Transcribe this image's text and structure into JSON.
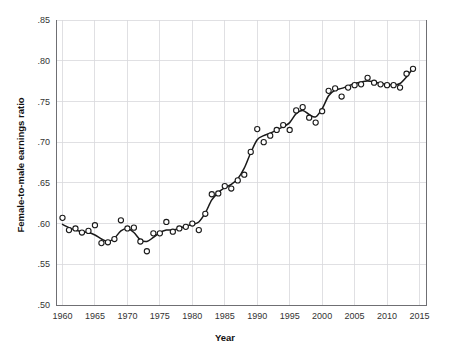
{
  "chart_data": {
    "type": "line",
    "title": "",
    "subtitle": "",
    "xlabel": "Year",
    "ylabel": "Female-to-male earnings ratio",
    "xlim": [
      1959,
      2016
    ],
    "ylim": [
      0.5,
      0.85
    ],
    "xticks": [
      1960,
      1965,
      1970,
      1975,
      1980,
      1985,
      1990,
      1995,
      2000,
      2005,
      2010,
      2015
    ],
    "xtick_labels": [
      "1960",
      "1965",
      "1970",
      "1975",
      "1980",
      "1985",
      "1990",
      "1995",
      "2000",
      "2005",
      "2010",
      "2015"
    ],
    "yticks": [
      0.5,
      0.55,
      0.6,
      0.65,
      0.7,
      0.75,
      0.8,
      0.85
    ],
    "ytick_labels": [
      ".50",
      ".55",
      ".60",
      ".65",
      ".70",
      ".75",
      ".80",
      ".85"
    ],
    "grid": true,
    "legend": false,
    "legend_position": "none",
    "marker": "open-circle",
    "annotations": [],
    "series": [
      {
        "name": "Female-to-male earnings ratio",
        "marker_color": "#1a1a1a",
        "line_color": "#1a1a1a",
        "x": [
          1960,
          1961,
          1962,
          1963,
          1964,
          1965,
          1966,
          1967,
          1968,
          1969,
          1970,
          1971,
          1972,
          1973,
          1974,
          1975,
          1976,
          1977,
          1978,
          1979,
          1980,
          1981,
          1982,
          1983,
          1984,
          1985,
          1986,
          1987,
          1988,
          1989,
          1990,
          1991,
          1992,
          1993,
          1994,
          1995,
          1996,
          1997,
          1998,
          1999,
          2000,
          2001,
          2002,
          2003,
          2004,
          2005,
          2006,
          2007,
          2008,
          2009,
          2010,
          2011,
          2012,
          2013,
          2014
        ],
        "values": [
          0.607,
          0.592,
          0.594,
          0.589,
          0.591,
          0.598,
          0.576,
          0.577,
          0.581,
          0.604,
          0.594,
          0.595,
          0.578,
          0.566,
          0.588,
          0.588,
          0.602,
          0.59,
          0.594,
          0.596,
          0.6,
          0.592,
          0.612,
          0.636,
          0.637,
          0.646,
          0.643,
          0.653,
          0.66,
          0.688,
          0.716,
          0.7,
          0.708,
          0.715,
          0.721,
          0.715,
          0.739,
          0.743,
          0.73,
          0.724,
          0.738,
          0.763,
          0.766,
          0.756,
          0.767,
          0.77,
          0.771,
          0.779,
          0.773,
          0.771,
          0.77,
          0.77,
          0.767,
          0.784,
          0.79
        ]
      },
      {
        "name": "smoothed trend",
        "type": "line-only",
        "line_color": "#1a1a1a",
        "x": [
          1960,
          1961,
          1962,
          1963,
          1964,
          1965,
          1966,
          1967,
          1968,
          1969,
          1970,
          1971,
          1972,
          1973,
          1974,
          1975,
          1976,
          1977,
          1978,
          1979,
          1980,
          1981,
          1982,
          1983,
          1984,
          1985,
          1986,
          1987,
          1988,
          1989,
          1990,
          1991,
          1992,
          1993,
          1994,
          1995,
          1996,
          1997,
          1998,
          1999,
          2000,
          2001,
          2002,
          2003,
          2004,
          2005,
          2006,
          2007,
          2008,
          2009,
          2010,
          2011,
          2012,
          2013,
          2014
        ],
        "values": [
          0.599,
          0.595,
          0.592,
          0.59,
          0.589,
          0.586,
          0.581,
          0.578,
          0.582,
          0.591,
          0.594,
          0.589,
          0.58,
          0.578,
          0.583,
          0.589,
          0.592,
          0.592,
          0.594,
          0.597,
          0.599,
          0.602,
          0.613,
          0.629,
          0.638,
          0.644,
          0.648,
          0.655,
          0.668,
          0.687,
          0.703,
          0.708,
          0.711,
          0.715,
          0.719,
          0.724,
          0.735,
          0.739,
          0.734,
          0.731,
          0.741,
          0.757,
          0.764,
          0.766,
          0.769,
          0.772,
          0.774,
          0.775,
          0.774,
          0.772,
          0.771,
          0.77,
          0.772,
          0.78,
          0.791
        ]
      }
    ]
  }
}
